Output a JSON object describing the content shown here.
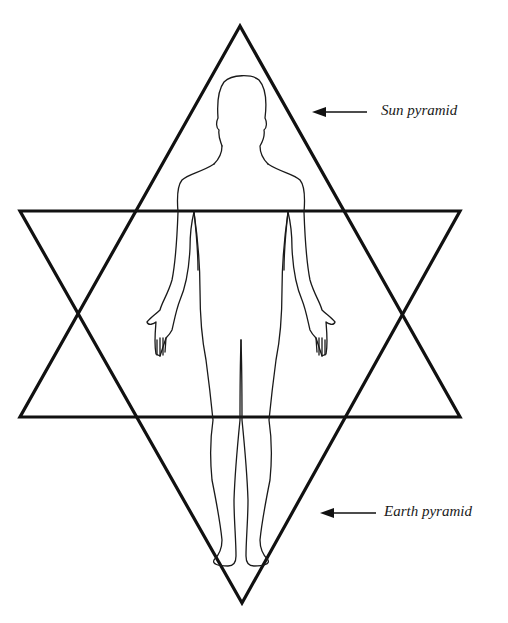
{
  "diagram": {
    "title": "",
    "shapes": [
      {
        "id": "sun-pyramid",
        "kind": "upward-triangle",
        "label": "Sun pyramid"
      },
      {
        "id": "earth-pyramid",
        "kind": "downward-triangle",
        "label": "Earth pyramid"
      }
    ],
    "figure": "human-body-outline-front-view",
    "labels": {
      "sun": "Sun pyramid",
      "earth": "Earth pyramid"
    },
    "arrows": [
      {
        "from": "sun-label",
        "to": "sun-pyramid",
        "direction": "left"
      },
      {
        "from": "earth-label",
        "to": "earth-pyramid",
        "direction": "left"
      }
    ],
    "colors": {
      "stroke": "#111111",
      "background": "#ffffff"
    }
  }
}
